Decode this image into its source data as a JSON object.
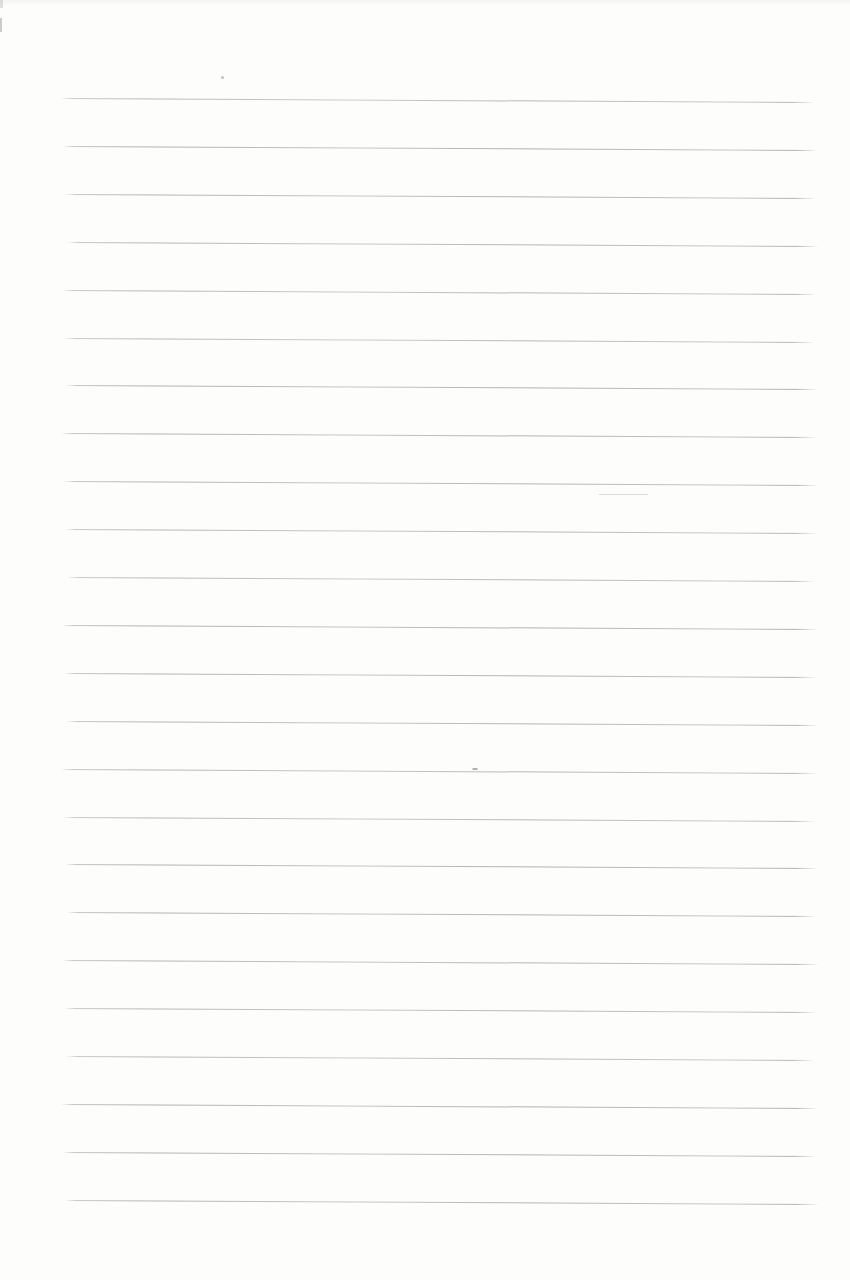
{
  "page": {
    "background_color": "#fdfdfc",
    "width": 850,
    "height": 1280,
    "text_content": ""
  },
  "ruled_lines": {
    "count": 24,
    "first_y": 98,
    "spacing": 47.9,
    "x_start": 64,
    "x_end": 817,
    "right_drop": 4,
    "color": "#afafaf",
    "color_light": "#c4c4c4",
    "thickness": 1.4
  },
  "artifacts": [
    {
      "kind": "speck-dot",
      "x": 221,
      "y": 76,
      "w": 3,
      "h": 3,
      "color": "#b2b0b0",
      "opacity": 0.8,
      "round": true
    },
    {
      "kind": "ghost-dash",
      "x": 599,
      "y": 494,
      "w": 49,
      "h": 1,
      "color": "#d6d6d6",
      "opacity": 0.9,
      "round": false
    },
    {
      "kind": "line-blot",
      "x": 472,
      "y": 768,
      "w": 6,
      "h": 2,
      "color": "#9c9a9a",
      "opacity": 0.85,
      "round": true
    },
    {
      "kind": "edge-smudge",
      "x": 0,
      "y": 18,
      "w": 2,
      "h": 14,
      "color": "#c6c6c4",
      "opacity": 0.9,
      "round": false
    },
    {
      "kind": "edge-smudge-2",
      "x": 0,
      "y": 0,
      "w": 3,
      "h": 8,
      "color": "#d2d2d0",
      "opacity": 0.7,
      "round": false
    }
  ]
}
